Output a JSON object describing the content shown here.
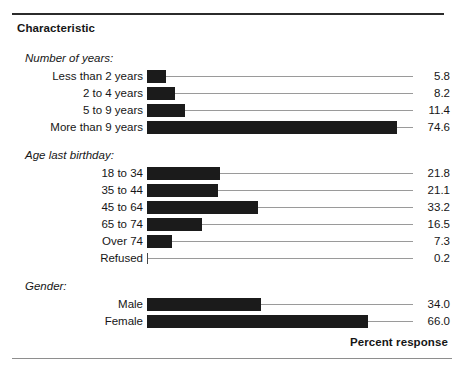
{
  "header": {
    "column_title": "Characteristic",
    "footer_label": "Percent response"
  },
  "chart_data": {
    "type": "bar",
    "orientation": "horizontal",
    "title": "Characteristic",
    "xlabel": "Percent response",
    "ylabel": "",
    "xlim": [
      0,
      80
    ],
    "grid": false,
    "legend": false,
    "units": "percent",
    "value_label_format": "one-decimal",
    "groups": [
      {
        "name": "Number of years:",
        "categories": [
          "Less than 2 years",
          "2 to 4 years",
          "5 to 9 years",
          "More than 9 years"
        ],
        "values": [
          5.8,
          8.2,
          11.4,
          74.6
        ]
      },
      {
        "name": "Age last birthday:",
        "categories": [
          "18 to 34",
          "35 to 44",
          "45 to 64",
          "65 to 74",
          "Over 74",
          "Refused"
        ],
        "values": [
          21.8,
          21.1,
          33.2,
          16.5,
          7.3,
          0.2
        ]
      },
      {
        "name": "Gender:",
        "categories": [
          "Male",
          "Female"
        ],
        "values": [
          34.0,
          66.0
        ]
      }
    ],
    "categories": [
      "Less than 2 years",
      "2 to 4 years",
      "5 to 9 years",
      "More than 9 years",
      "18 to 34",
      "35 to 44",
      "45 to 64",
      "65 to 74",
      "Over 74",
      "Refused",
      "Male",
      "Female"
    ],
    "values": [
      5.8,
      8.2,
      11.4,
      74.6,
      21.8,
      21.1,
      33.2,
      16.5,
      7.3,
      0.2,
      34.0,
      66.0
    ],
    "value_labels": [
      "5.8",
      "8.2",
      "11.4",
      "74.6",
      "21.8",
      "21.1",
      "33.2",
      "16.5",
      "7.3",
      "0.2",
      "34.0",
      "66.0"
    ],
    "colors": {
      "bar": "#1b1b1b",
      "leader_line": "#9a9a9a",
      "rule_top": "#2b2b2b",
      "rule_bottom": "#8e8e8e",
      "text": "#161616",
      "background": "#ffffff"
    }
  },
  "layout": {
    "bar_origin_x": 147,
    "px_per_unit": 3.35,
    "leader_end_x": 413
  }
}
